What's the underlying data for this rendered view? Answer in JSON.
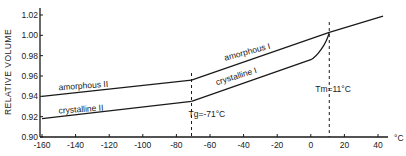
{
  "chart_data": {
    "type": "line",
    "title": "",
    "xlabel": "°C",
    "ylabel": "RELATIVE VOLUME",
    "xlim": [
      -160,
      40
    ],
    "ylim": [
      0.9,
      1.02
    ],
    "x_ticks": [
      -160,
      -140,
      -120,
      -100,
      -80,
      -60,
      -40,
      -20,
      0,
      20,
      40
    ],
    "x_tick_labels": [
      "-160",
      "-140",
      "-120",
      "-100",
      "-80",
      "-60",
      "-40",
      "-20",
      "0",
      "20",
      "40"
    ],
    "y_ticks": [
      0.9,
      0.92,
      0.94,
      0.96,
      0.98,
      1.0,
      1.02
    ],
    "y_tick_labels": [
      "0.90",
      "0.92",
      "0.94",
      "0.96",
      "0.98",
      "1.00",
      "1.02"
    ],
    "grid": false,
    "legend": null,
    "series": [
      {
        "name": "amorphous II",
        "x": [
          -160,
          -71
        ],
        "y": [
          0.94,
          0.956
        ]
      },
      {
        "name": "amorphous I",
        "x": [
          -71,
          11,
          43
        ],
        "y": [
          0.956,
          1.003,
          1.019
        ]
      },
      {
        "name": "crystalline II",
        "x": [
          -160,
          -71
        ],
        "y": [
          0.918,
          0.935
        ]
      },
      {
        "name": "crystalline I",
        "x": [
          -71,
          0,
          5,
          9,
          11
        ],
        "y": [
          0.935,
          0.976,
          0.982,
          0.992,
          1.003
        ]
      }
    ],
    "vlines": [
      {
        "x": -71,
        "label": "Tg=-71°C",
        "style": "dashed"
      },
      {
        "x": 11,
        "label": "Tm=11°C",
        "style": "dashed"
      }
    ],
    "annotations": [
      {
        "text": "amorphous II",
        "x": -125,
        "y": 0.95
      },
      {
        "text": "crystalline II",
        "x": -125,
        "y": 0.928
      },
      {
        "text": "amorphous I",
        "x": -30,
        "y": 0.985
      },
      {
        "text": "crystalline I",
        "x": -35,
        "y": 0.963
      },
      {
        "text": "Tg=-71°C",
        "x": -71,
        "y": 0.91
      },
      {
        "text": "Tm=11°C",
        "x": 11,
        "y": 0.942
      }
    ]
  },
  "labels": {
    "ylabel": "RELATIVE VOLUME",
    "xunit": "°C",
    "amorphous_2": "amorphous II",
    "crystalline_2": "crystalline II",
    "amorphous_1": "amorphous I",
    "crystalline_1": "crystalline I",
    "tg": "Tg=-71°C",
    "tm": "Tm=11°C"
  }
}
